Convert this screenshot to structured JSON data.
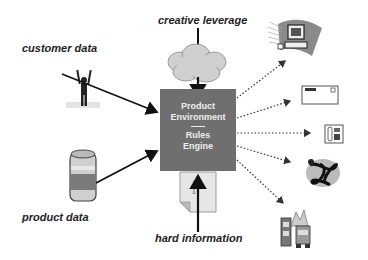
{
  "diagram": {
    "center_box": {
      "line1": "Product",
      "line2": "Environment",
      "separator": "——",
      "line3": "Rules",
      "line4": "Engine",
      "color": "#6f6f6f"
    },
    "inputs": {
      "top": "creative leverage",
      "left_top": "customer data",
      "left_bottom": "product data",
      "bottom": "hard information"
    },
    "input_icons": {
      "top": "cloud-icon",
      "left_top": "person-arms-raised-icon",
      "left_bottom": "soda-can-icon",
      "bottom": "info-document-icon"
    },
    "output_icons": [
      "computer-icon",
      "envelope-icon",
      "telephone-icon",
      "tangled-network-icon",
      "factory-icon"
    ]
  }
}
